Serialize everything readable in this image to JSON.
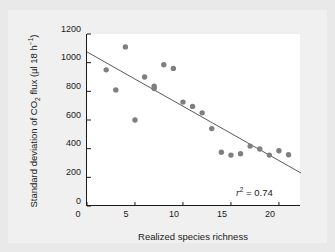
{
  "figure": {
    "background": "#e9e9e9",
    "panel_background": "#f0f0f0",
    "plot_background": "#ffffff"
  },
  "annotation": {
    "r_symbol": "r",
    "r_exponent": "2",
    "equals_value": " = 0.74"
  },
  "chart_data": {
    "type": "scatter",
    "title": "",
    "xlabel": "Realized species richness",
    "ylabel_plain": "Standard deviation of CO2 flux (ul 18 h-1)",
    "ylabel_parts": {
      "prefix": "Standard deviation of CO",
      "sub": "2",
      "middle": " flux (µl 18 h",
      "sup": "−1",
      "suffix": ")"
    },
    "xlim": [
      0,
      22.3
    ],
    "ylim": [
      0,
      1200
    ],
    "xticks": [
      0,
      5,
      10,
      15,
      20
    ],
    "yticks": [
      0,
      200,
      400,
      600,
      800,
      1000,
      1200
    ],
    "grid": false,
    "legend": null,
    "marker_color": "#7f7f7f",
    "marker_size_px": 5.4,
    "line_color": "#5a5a5a",
    "points": [
      {
        "x": 2,
        "y": 950
      },
      {
        "x": 3,
        "y": 810
      },
      {
        "x": 4,
        "y": 1110
      },
      {
        "x": 5,
        "y": 600
      },
      {
        "x": 6,
        "y": 900
      },
      {
        "x": 7,
        "y": 835
      },
      {
        "x": 7,
        "y": 820
      },
      {
        "x": 8,
        "y": 985
      },
      {
        "x": 9,
        "y": 960
      },
      {
        "x": 10,
        "y": 725
      },
      {
        "x": 11,
        "y": 695
      },
      {
        "x": 12,
        "y": 650
      },
      {
        "x": 13,
        "y": 540
      },
      {
        "x": 14,
        "y": 375
      },
      {
        "x": 15,
        "y": 355
      },
      {
        "x": 16,
        "y": 365
      },
      {
        "x": 17,
        "y": 418
      },
      {
        "x": 18,
        "y": 398
      },
      {
        "x": 19,
        "y": 355
      },
      {
        "x": 20,
        "y": 385
      },
      {
        "x": 21,
        "y": 358
      }
    ],
    "fit_line": {
      "x_start": 0,
      "y_start": 1075,
      "x_end": 22.3,
      "y_end": 230,
      "r_squared": 0.74
    }
  }
}
